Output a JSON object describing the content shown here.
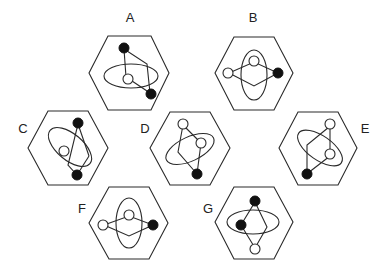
{
  "figure": {
    "colors": {
      "stroke": "#2a2a2a",
      "filled": "#111111",
      "background": "#ffffff"
    },
    "panels": [
      {
        "label": "A",
        "ellipse": "horizontal",
        "circles": [
          "filled",
          "open",
          "filled"
        ]
      },
      {
        "label": "B",
        "ellipse": "vertical",
        "circles": [
          "open",
          "open",
          "filled"
        ]
      },
      {
        "label": "C",
        "ellipse": "tilted",
        "circles": [
          "filled",
          "open",
          "filled"
        ]
      },
      {
        "label": "D",
        "ellipse": "tilted",
        "circles": [
          "open",
          "open",
          "filled"
        ]
      },
      {
        "label": "E",
        "ellipse": "tilted",
        "circles": [
          "open",
          "open",
          "filled"
        ]
      },
      {
        "label": "F",
        "ellipse": "vertical",
        "circles": [
          "open",
          "open",
          "filled"
        ]
      },
      {
        "label": "G",
        "ellipse": "horizontal",
        "circles": [
          "filled",
          "filled",
          "open"
        ]
      }
    ]
  }
}
